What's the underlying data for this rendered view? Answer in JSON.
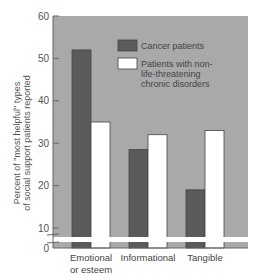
{
  "chart_data": {
    "type": "bar",
    "title": "",
    "xlabel": "",
    "ylabel": "Percent of \"most helpful\" types of social support patients reported",
    "ylabel_lines": [
      "Percent of \"most helpful\" types",
      "of social support patients reported"
    ],
    "ylim": [
      0,
      60
    ],
    "yticks": [
      0,
      10,
      20,
      30,
      40,
      50,
      60
    ],
    "axis_break": true,
    "grid": false,
    "legend_position": "upper right (inside plot)",
    "categories": [
      "Emotional or esteem",
      "Informational",
      "Tangible"
    ],
    "category_lines": [
      [
        "Emotional",
        "or esteem"
      ],
      [
        "Informational"
      ],
      [
        "Tangible"
      ]
    ],
    "series": [
      {
        "name": "Cancer patients",
        "color": "#5a5a5a",
        "values": [
          52,
          28.5,
          19
        ]
      },
      {
        "name": "Patients with non-life-threatening chronic disorders",
        "color": "#ffffff",
        "values": [
          35,
          32,
          33
        ]
      }
    ],
    "legend": [
      {
        "label_lines": [
          "Cancer patients"
        ],
        "color": "#5a5a5a"
      },
      {
        "label_lines": [
          "Patients with non-",
          "life-threatening",
          "chronic disorders"
        ],
        "color": "#ffffff"
      }
    ],
    "colors": {
      "plot_bg": "#a9a9a9",
      "axis": "#666666",
      "break_band": "#ffffff"
    }
  }
}
